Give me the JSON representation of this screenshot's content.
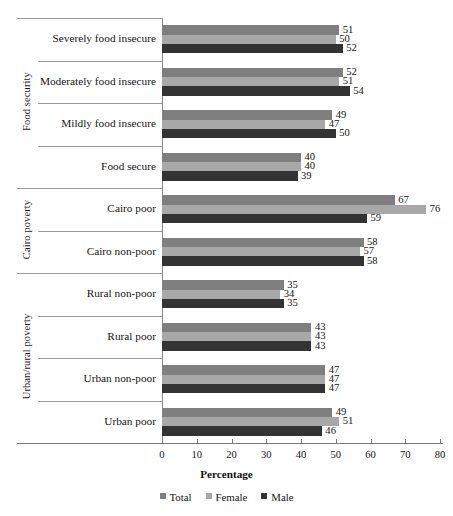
{
  "chart_data": {
    "type": "bar",
    "orientation": "horizontal",
    "title": "",
    "xlabel": "Percentage",
    "ylabel": "",
    "xlim": [
      0,
      80
    ],
    "xticks": [
      0,
      10,
      20,
      30,
      40,
      50,
      60,
      70,
      80
    ],
    "grid": false,
    "legend_position": "bottom",
    "legend": [
      "Total",
      "Female",
      "Male"
    ],
    "series": [
      {
        "name": "Total",
        "color": "#7f7f7f",
        "values": [
          51,
          52,
          49,
          40,
          67,
          58,
          35,
          43,
          47,
          49
        ]
      },
      {
        "name": "Female",
        "color": "#a8a8a8",
        "values": [
          50,
          51,
          47,
          40,
          76,
          57,
          34,
          43,
          47,
          51
        ]
      },
      {
        "name": "Male",
        "color": "#333333",
        "values": [
          52,
          54,
          50,
          39,
          59,
          58,
          35,
          43,
          47,
          46
        ]
      }
    ],
    "categories": [
      "Severely food insecure",
      "Moderately food insecure",
      "Mildly food insecure",
      "Food secure",
      "Cairo poor",
      "Cairo non-poor",
      "Rural non-poor",
      "Rural poor",
      "Urban non-poor",
      "Urban poor"
    ],
    "groups": [
      {
        "label": "Food security",
        "categories": [
          "Severely food insecure",
          "Moderately food insecure",
          "Mildly food insecure",
          "Food secure"
        ]
      },
      {
        "label": "Cairo poverty",
        "categories": [
          "Cairo poor",
          "Cairo non-poor"
        ]
      },
      {
        "label": "Urban/rural poverty",
        "categories": [
          "Rural non-poor",
          "Rural poor",
          "Urban non-poor",
          "Urban poor"
        ]
      }
    ],
    "rows": [
      {
        "category": "Severely food insecure",
        "group": "Food security",
        "total": 51,
        "female": 50,
        "male": 52
      },
      {
        "category": "Moderately food insecure",
        "group": "Food security",
        "total": 52,
        "female": 51,
        "male": 54
      },
      {
        "category": "Mildly food insecure",
        "group": "Food security",
        "total": 49,
        "female": 47,
        "male": 50
      },
      {
        "category": "Food secure",
        "group": "Food security",
        "total": 40,
        "female": 40,
        "male": 39
      },
      {
        "category": "Cairo poor",
        "group": "Cairo poverty",
        "total": 67,
        "female": 76,
        "male": 59
      },
      {
        "category": "Cairo non-poor",
        "group": "Cairo poverty",
        "total": 58,
        "female": 57,
        "male": 58
      },
      {
        "category": "Rural non-poor",
        "group": "Urban/rural poverty",
        "total": 35,
        "female": 34,
        "male": 35
      },
      {
        "category": "Rural poor",
        "group": "Urban/rural poverty",
        "total": 43,
        "female": 43,
        "male": 43
      },
      {
        "category": "Urban non-poor",
        "group": "Urban/rural poverty",
        "total": 47,
        "female": 47,
        "male": 47
      },
      {
        "category": "Urban poor",
        "group": "Urban/rural poverty",
        "total": 49,
        "female": 51,
        "male": 46
      }
    ],
    "colors": {
      "total": "#7f7f7f",
      "female": "#a8a8a8",
      "male": "#333333",
      "axis": "#7a7a7a",
      "separator": "#9a9a9a",
      "text": "#131313",
      "background": "#ffffff"
    }
  },
  "axis": {
    "x_title": "Percentage",
    "tick_labels": [
      "0",
      "10",
      "20",
      "30",
      "40",
      "50",
      "60",
      "70",
      "80"
    ]
  },
  "legend": {
    "items": [
      {
        "label": "Total",
        "swatch": "total"
      },
      {
        "label": "Female",
        "swatch": "female"
      },
      {
        "label": "Male",
        "swatch": "male"
      }
    ]
  }
}
